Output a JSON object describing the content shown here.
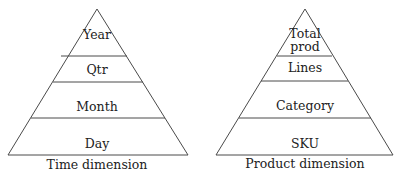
{
  "diagram": {
    "type": "hierarchy-pyramids",
    "pyramids": [
      {
        "id": "time",
        "caption": "Time dimension",
        "levels": [
          {
            "label": "Year"
          },
          {
            "label": "Qtr"
          },
          {
            "label": "Month"
          },
          {
            "label": "Day"
          }
        ]
      },
      {
        "id": "product",
        "caption": "Product dimension",
        "levels": [
          {
            "label_line1": "Total",
            "label_line2": "prod"
          },
          {
            "label": "Lines"
          },
          {
            "label": "Category"
          },
          {
            "label": "SKU"
          }
        ]
      }
    ],
    "colors": {
      "stroke": "#4a4a4a",
      "text": "#222222",
      "background": "#ffffff"
    }
  }
}
